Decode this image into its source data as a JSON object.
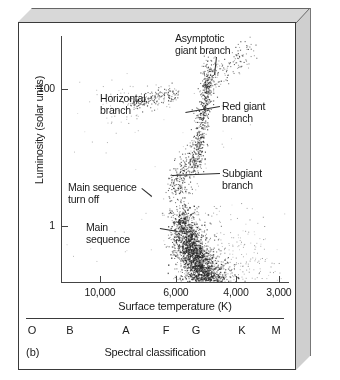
{
  "figure": {
    "panel_label": "(b)",
    "type": "hertzsprung-russell-diagram"
  },
  "chart_data": {
    "type": "scatter",
    "title": "",
    "xlabel": "Surface temperature (K)",
    "ylabel": "Luminosity (solar units)",
    "xscale": "log-reversed",
    "yscale": "log",
    "xlim": [
      13000,
      2800
    ],
    "ylim": [
      0.15,
      600
    ],
    "grid": false,
    "legend": false,
    "xticks": [
      10000,
      6000,
      4000,
      3000
    ],
    "xticklabels": [
      "10,000",
      "6,000",
      "4,000",
      "3,000"
    ],
    "yticks": [
      100,
      1
    ],
    "yticklabels": [
      "100",
      "1"
    ],
    "secondary_axis": {
      "label": "Spectral classification",
      "ticklabels": [
        "O",
        "B",
        "A",
        "F",
        "G",
        "K",
        "M"
      ]
    },
    "annotations": [
      {
        "text": "Asymptotic\ngiant branch",
        "x": 175,
        "y": 33,
        "leader_to": [
          215,
          75
        ]
      },
      {
        "text": "Horizontal\nbranch",
        "x": 100,
        "y": 93,
        "leader_to": null
      },
      {
        "text": "Red giant\nbranch",
        "x": 222,
        "y": 101,
        "leader_to": [
          186,
          113
        ]
      },
      {
        "text": "Subgiant\nbranch",
        "x": 222,
        "y": 168,
        "leader_to": [
          172,
          176
        ]
      },
      {
        "text": "Main sequence\nturn off",
        "x": 68,
        "y": 182,
        "leader_to": [
          152,
          196
        ]
      },
      {
        "text": "Main\nsequence",
        "x": 86,
        "y": 222,
        "leader_to": [
          178,
          231
        ]
      }
    ],
    "populations": [
      {
        "name": "main-sequence",
        "n_points": 2600,
        "description": "dense cloud of faint cool stars"
      },
      {
        "name": "subgiant-branch",
        "n_points": 260,
        "description": "bridge rising from turn-off"
      },
      {
        "name": "red-giant-branch",
        "n_points": 520,
        "description": "narrow rising strip near 5,000 K"
      },
      {
        "name": "horizontal-branch",
        "n_points": 210,
        "description": "flat strip near 100 solar luminosities"
      },
      {
        "name": "asymptotic-giant-branch",
        "n_points": 130,
        "description": "sparse diagonal trail to upper right"
      }
    ]
  }
}
